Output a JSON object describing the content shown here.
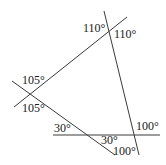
{
  "diagram": {
    "lines": [
      {
        "id": "line-a",
        "x1": 127,
        "y1": 17,
        "x2": 14,
        "y2": 107
      },
      {
        "id": "line-b",
        "x1": 104,
        "y1": 11,
        "x2": 139,
        "y2": 155
      },
      {
        "id": "line-c",
        "x1": 12,
        "y1": 81,
        "x2": 115,
        "y2": 155
      },
      {
        "id": "line-d",
        "x1": 53,
        "y1": 135,
        "x2": 160,
        "y2": 135
      }
    ],
    "angles": [
      {
        "id": "angle-top-left",
        "label": "110°",
        "x": 83,
        "y": 32
      },
      {
        "id": "angle-top-right",
        "label": "110°",
        "x": 114,
        "y": 38
      },
      {
        "id": "angle-left-upper",
        "label": "105°",
        "x": 22,
        "y": 84
      },
      {
        "id": "angle-left-lower",
        "label": "105°",
        "x": 22,
        "y": 112
      },
      {
        "id": "angle-bottom-left-30",
        "label": "30°",
        "x": 54,
        "y": 132
      },
      {
        "id": "angle-bottom-mid-30",
        "label": "30°",
        "x": 101,
        "y": 144
      },
      {
        "id": "angle-bottom-right-100-upper",
        "label": "100°",
        "x": 136,
        "y": 130
      },
      {
        "id": "angle-bottom-right-100-lower",
        "label": "100°",
        "x": 113,
        "y": 155
      }
    ]
  }
}
